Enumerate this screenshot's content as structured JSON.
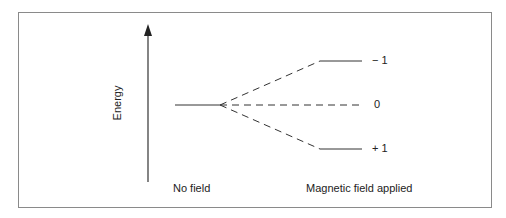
{
  "diagram": {
    "axis_label": "Energy",
    "left_caption": "No field",
    "right_caption": "Magnetic field applied",
    "levels": [
      {
        "label": "− 1",
        "position": "upper"
      },
      {
        "label": "0",
        "position": "middle"
      },
      {
        "label": "+ 1",
        "position": "lower"
      }
    ],
    "colors": {
      "line": "#333333",
      "frame": "#8a8a8a",
      "text": "#222222"
    }
  }
}
